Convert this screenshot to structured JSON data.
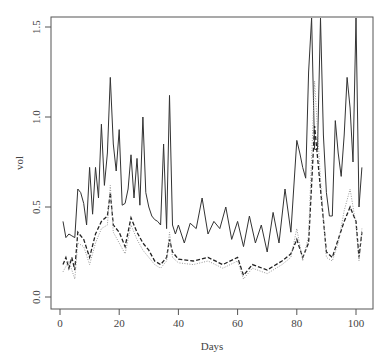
{
  "chart_data": {
    "type": "line",
    "title": "",
    "xlabel": "Days",
    "ylabel": "vol",
    "xlim": [
      0,
      103
    ],
    "ylim": [
      0,
      1.55
    ],
    "xticks": [
      0,
      20,
      40,
      60,
      80,
      100
    ],
    "yticks": [
      "0.0",
      "0.5",
      "1.0",
      "1.5"
    ],
    "grid": false,
    "legend": null,
    "series": [
      {
        "name": "solid",
        "style": "solid",
        "x": [
          1,
          2,
          3,
          4,
          5,
          6,
          7,
          8,
          9,
          10,
          11,
          12,
          13,
          14,
          15,
          16,
          17,
          18,
          19,
          20,
          21,
          22,
          23,
          24,
          25,
          26,
          27,
          28,
          29,
          30,
          31,
          32,
          33,
          34,
          35,
          36,
          37,
          38,
          39,
          40,
          42,
          44,
          46,
          48,
          50,
          52,
          54,
          56,
          58,
          60,
          62,
          64,
          66,
          68,
          70,
          72,
          74,
          76,
          78,
          80,
          81,
          82,
          83,
          84,
          85,
          86,
          87,
          88,
          89,
          90,
          91,
          92,
          93,
          94,
          95,
          96,
          97,
          98,
          99,
          100,
          101,
          102
        ],
        "y": [
          0.42,
          0.33,
          0.35,
          0.34,
          0.33,
          0.6,
          0.58,
          0.52,
          0.4,
          0.72,
          0.46,
          0.72,
          0.55,
          0.96,
          0.62,
          0.8,
          1.22,
          0.85,
          0.7,
          0.93,
          0.51,
          0.52,
          0.6,
          0.79,
          0.55,
          0.77,
          0.51,
          1.0,
          0.58,
          0.5,
          0.45,
          0.43,
          0.42,
          0.4,
          0.85,
          0.38,
          1.12,
          0.4,
          0.35,
          0.4,
          0.3,
          0.41,
          0.38,
          0.55,
          0.35,
          0.42,
          0.38,
          0.5,
          0.32,
          0.42,
          0.28,
          0.45,
          0.3,
          0.4,
          0.25,
          0.47,
          0.3,
          0.6,
          0.36,
          0.87,
          0.8,
          0.72,
          0.66,
          1.25,
          1.55,
          0.82,
          0.82,
          1.55,
          0.9,
          0.58,
          0.45,
          0.45,
          0.98,
          0.8,
          0.67,
          0.9,
          1.22,
          1.05,
          0.75,
          1.55,
          0.5,
          0.72
        ]
      },
      {
        "name": "dashed",
        "style": "dashed",
        "x": [
          1,
          2,
          3,
          4,
          5,
          6,
          8,
          10,
          12,
          14,
          16,
          17,
          18,
          20,
          22,
          24,
          26,
          28,
          30,
          32,
          34,
          36,
          37,
          38,
          40,
          45,
          50,
          55,
          60,
          62,
          65,
          70,
          75,
          78,
          80,
          82,
          84,
          86,
          88,
          90,
          92,
          94,
          96,
          98,
          100,
          101,
          102
        ],
        "y": [
          0.18,
          0.22,
          0.16,
          0.22,
          0.15,
          0.36,
          0.32,
          0.22,
          0.35,
          0.42,
          0.45,
          0.58,
          0.4,
          0.36,
          0.28,
          0.44,
          0.36,
          0.3,
          0.26,
          0.2,
          0.18,
          0.22,
          0.32,
          0.25,
          0.21,
          0.2,
          0.22,
          0.18,
          0.22,
          0.12,
          0.18,
          0.15,
          0.2,
          0.24,
          0.32,
          0.22,
          0.3,
          0.95,
          0.6,
          0.25,
          0.22,
          0.32,
          0.42,
          0.5,
          0.42,
          0.22,
          0.36
        ]
      },
      {
        "name": "dotted",
        "style": "dotted",
        "x": [
          1,
          3,
          5,
          6,
          8,
          10,
          12,
          14,
          16,
          17,
          18,
          20,
          22,
          24,
          26,
          28,
          30,
          32,
          34,
          36,
          37,
          38,
          40,
          45,
          50,
          55,
          60,
          62,
          65,
          70,
          75,
          78,
          80,
          82,
          84,
          86,
          88,
          90,
          92,
          94,
          96,
          98,
          100,
          101,
          102
        ],
        "y": [
          0.14,
          0.2,
          0.1,
          0.3,
          0.28,
          0.18,
          0.3,
          0.38,
          0.4,
          0.62,
          0.36,
          0.3,
          0.24,
          0.4,
          0.32,
          0.26,
          0.22,
          0.18,
          0.16,
          0.2,
          0.36,
          0.22,
          0.19,
          0.18,
          0.2,
          0.16,
          0.2,
          0.1,
          0.16,
          0.13,
          0.18,
          0.22,
          0.38,
          0.2,
          0.34,
          1.2,
          0.65,
          0.22,
          0.2,
          0.3,
          0.48,
          0.6,
          0.4,
          0.2,
          0.38
        ]
      }
    ]
  }
}
